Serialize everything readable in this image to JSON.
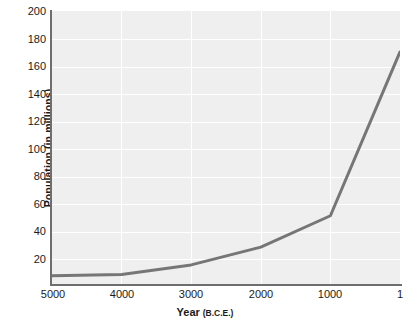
{
  "chart_data": {
    "type": "line",
    "title": "",
    "xlabel": "Year",
    "xlabel_unit": "(B.C.E.)",
    "ylabel": "Population (in millions)",
    "x": [
      5000,
      4000,
      3000,
      2000,
      1000,
      1
    ],
    "values": [
      6,
      7,
      14,
      27,
      50,
      170
    ],
    "categories": [
      "5000",
      "4000",
      "3000",
      "2000",
      "1000",
      "1"
    ],
    "xtick_labels": [
      "5000",
      "4000",
      "3000",
      "2000",
      "1000",
      "1"
    ],
    "ytick_labels": [
      "200",
      "180",
      "160",
      "140",
      "120",
      "100",
      "80",
      "60",
      "40",
      "20"
    ],
    "yticks": [
      200,
      180,
      160,
      140,
      120,
      100,
      80,
      60,
      40,
      20
    ],
    "ylim": [
      0,
      200
    ],
    "xlim_note": "time axis runs 5000 B.C.E. on left to 1 B.C.E. on right",
    "grid": "white gridlines on light gray plot background",
    "legend": "none",
    "series": [
      {
        "name": "World population",
        "values": [
          6,
          7,
          14,
          27,
          50,
          170
        ]
      }
    ],
    "colors": {
      "line": "#767676",
      "plot_background": "#efefef",
      "gridline": "#ffffff",
      "axis": "#6e6e6e",
      "text": "#1a1a1a"
    }
  }
}
